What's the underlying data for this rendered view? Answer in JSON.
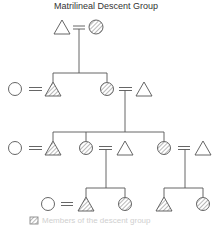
{
  "diagram": {
    "title": "Matrilineal Descent Group",
    "type": "kinship-chart",
    "colors": {
      "line": "#555555",
      "hatch": "#888888",
      "background": "#ffffff"
    },
    "symbols": {
      "male": "triangle",
      "female": "circle",
      "marriage": "double-line",
      "member": "hatched"
    },
    "generations": [
      {
        "level": 1,
        "people": [
          {
            "sex": "male",
            "member": false
          },
          {
            "sex": "female",
            "member": true
          }
        ]
      },
      {
        "level": 2,
        "people": [
          {
            "sex": "female",
            "member": false
          },
          {
            "sex": "male",
            "member": true
          },
          {
            "sex": "female",
            "member": true
          },
          {
            "sex": "male",
            "member": false
          }
        ]
      },
      {
        "level": 3,
        "people": [
          {
            "sex": "female",
            "member": false
          },
          {
            "sex": "male",
            "member": true
          },
          {
            "sex": "female",
            "member": true
          },
          {
            "sex": "male",
            "member": false
          },
          {
            "sex": "female",
            "member": true
          },
          {
            "sex": "male",
            "member": false
          }
        ]
      },
      {
        "level": 4,
        "people": [
          {
            "sex": "female",
            "member": false
          },
          {
            "sex": "male",
            "member": true
          },
          {
            "sex": "female",
            "member": true
          },
          {
            "sex": "male",
            "member": true
          },
          {
            "sex": "female",
            "member": true
          }
        ]
      }
    ],
    "legend": {
      "label": "Members of the descent group"
    }
  }
}
